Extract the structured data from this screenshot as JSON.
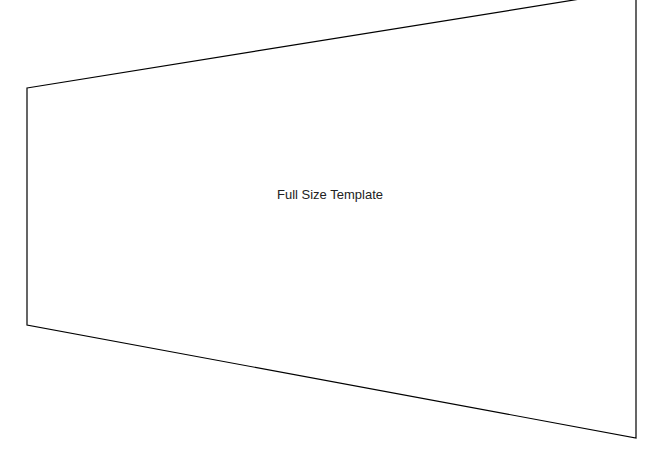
{
  "template": {
    "label": "Full Size Template",
    "stroke_color": "#000000",
    "background": "#ffffff",
    "corners": {
      "top_left": [
        27,
        88
      ],
      "top_right": [
        636,
        -10
      ],
      "bottom_right": [
        636,
        438
      ],
      "bottom_left": [
        27,
        325
      ]
    }
  }
}
